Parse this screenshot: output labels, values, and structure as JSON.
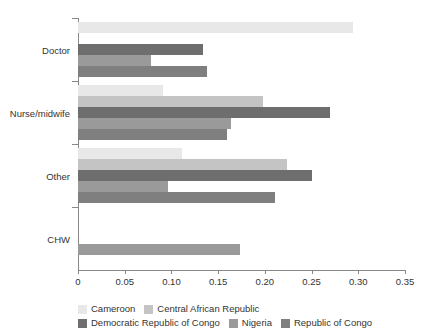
{
  "chart_data": {
    "type": "bar",
    "orientation": "horizontal",
    "title": "",
    "subtitle": "",
    "xlabel": "",
    "ylabel": "",
    "xlim": [
      0,
      0.35
    ],
    "xticks": [
      "0",
      "0.05",
      "0.10",
      "0.15",
      "0.20",
      "0.25",
      "0.30",
      "0.35"
    ],
    "xtick_values": [
      0,
      0.05,
      0.1,
      0.15,
      0.2,
      0.25,
      0.3,
      0.35
    ],
    "grid": false,
    "legend_position": "bottom",
    "categories": [
      "Doctor",
      "Nurse/midwife",
      "Other",
      "CHW"
    ],
    "series": [
      {
        "name": "Cameroon",
        "color": "#e8e8e8",
        "values": [
          0.294,
          0.091,
          0.111,
          null
        ]
      },
      {
        "name": "Central African Republic",
        "color": "#c4c4c4",
        "values": [
          null,
          0.198,
          0.224,
          null
        ]
      },
      {
        "name": "Democratic Republic of Congo",
        "color": "#6e6e6e",
        "values": [
          0.134,
          0.27,
          0.25,
          null
        ]
      },
      {
        "name": "Nigeria",
        "color": "#9a9a9a",
        "values": [
          0.078,
          0.164,
          0.096,
          0.173
        ]
      },
      {
        "name": "Republic of Congo",
        "color": "#7f7f7f",
        "values": [
          0.138,
          0.16,
          0.211,
          null
        ]
      }
    ]
  },
  "axis": {
    "color": "#888888"
  }
}
